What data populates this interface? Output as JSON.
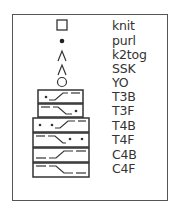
{
  "legend": {
    "title": "Knitting chart key",
    "items": [
      {
        "symbol": "open-square",
        "label": "knit"
      },
      {
        "symbol": "filled-dot",
        "label": "purl"
      },
      {
        "symbol": "left-lean-lambda",
        "label": "k2tog"
      },
      {
        "symbol": "lambda",
        "label": "SSK"
      },
      {
        "symbol": "open-circle",
        "label": "YO"
      },
      {
        "symbol": "cable-3-back-twist",
        "label": "T3B"
      },
      {
        "symbol": "cable-3-front-twist",
        "label": "T3F"
      },
      {
        "symbol": "cable-4-back-twist",
        "label": "T4B"
      },
      {
        "symbol": "cable-4-front-twist",
        "label": "T4F"
      },
      {
        "symbol": "cable-4-back-cross",
        "label": "C4B"
      },
      {
        "symbol": "cable-4-front-cross",
        "label": "C4F"
      }
    ]
  },
  "colors": {
    "ink": "#333333",
    "frame": "#555555",
    "background": "#ffffff"
  }
}
